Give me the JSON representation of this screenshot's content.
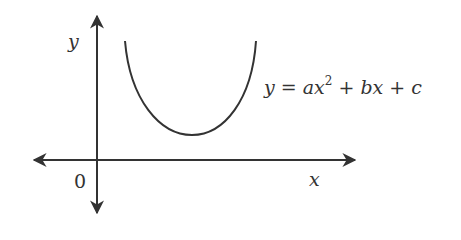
{
  "diagram": {
    "axes": {
      "x_label": "x",
      "y_label": "y",
      "origin_label": "0"
    },
    "curve": {
      "type": "parabola",
      "opens": "up",
      "equation": {
        "lhs": "y = ax",
        "exponent": "2",
        "rhs": " + bx + c"
      }
    },
    "colors": {
      "stroke": "#333333",
      "background": "#ffffff"
    }
  }
}
